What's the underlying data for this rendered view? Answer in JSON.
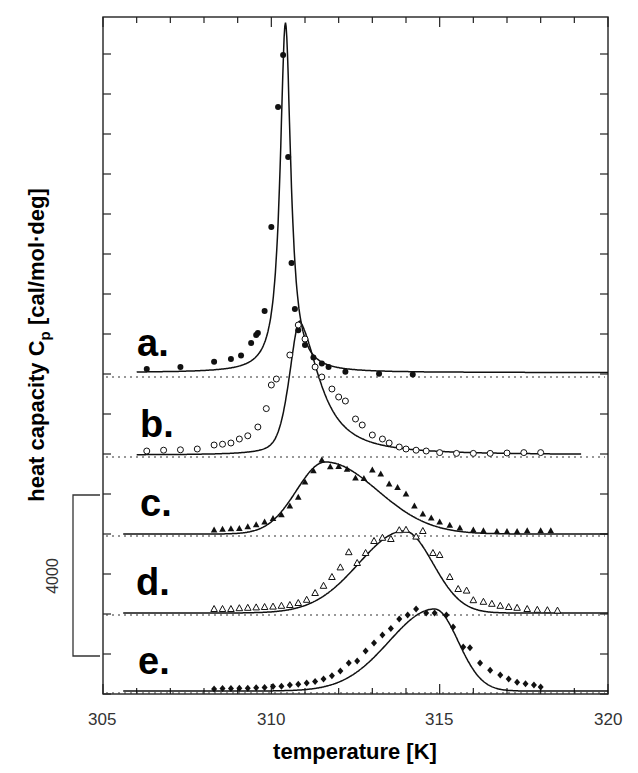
{
  "chart_data": {
    "type": "line",
    "title": "",
    "xlabel": "temperature [K]",
    "ylabel": "heat capacity C_p [cal/mol·deg]",
    "ylabel_main": "heat capacity C",
    "ylabel_sub": "p",
    "ylabel_unit": " [cal/mol·deg]",
    "xlim": [
      305,
      320
    ],
    "xticks": [
      "305",
      "310",
      "315",
      "320"
    ],
    "scale_bar": {
      "label": "4000",
      "value": 4000
    },
    "grid": false,
    "legend": "inline panel labels a.–e.",
    "series": [
      {
        "name": "a.",
        "marker": "filled-circle",
        "peak_T": 310.4,
        "peak_height_rel": 8750,
        "points": [
          [
            306.3,
            150
          ],
          [
            307.3,
            200
          ],
          [
            308.3,
            330
          ],
          [
            308.8,
            400
          ],
          [
            309.1,
            490
          ],
          [
            309.4,
            800
          ],
          [
            309.55,
            1000
          ],
          [
            309.6,
            1050
          ],
          [
            309.8,
            1600
          ],
          [
            310.0,
            3700
          ],
          [
            310.2,
            6700
          ],
          [
            310.35,
            8000
          ],
          [
            310.5,
            5450
          ],
          [
            310.6,
            2800
          ],
          [
            310.7,
            1650
          ],
          [
            310.8,
            1120
          ],
          [
            311.0,
            750
          ],
          [
            311.25,
            440
          ],
          [
            311.5,
            290
          ],
          [
            311.7,
            200
          ],
          [
            312.2,
            80
          ],
          [
            313.2,
            30
          ],
          [
            314.2,
            10
          ]
        ]
      },
      {
        "name": "b.",
        "marker": "open-circle",
        "peak_T": 310.8,
        "peak_height_rel": 3350,
        "points": [
          [
            306.3,
            100
          ],
          [
            306.8,
            120
          ],
          [
            307.3,
            130
          ],
          [
            307.8,
            150
          ],
          [
            308.3,
            250
          ],
          [
            308.55,
            270
          ],
          [
            308.8,
            300
          ],
          [
            309.05,
            400
          ],
          [
            309.3,
            480
          ],
          [
            309.6,
            700
          ],
          [
            309.85,
            1160
          ],
          [
            310.0,
            1750
          ],
          [
            310.15,
            1900
          ],
          [
            310.55,
            2500
          ],
          [
            310.8,
            3250
          ],
          [
            311.0,
            2900
          ],
          [
            311.3,
            2200
          ],
          [
            311.5,
            1950
          ],
          [
            311.8,
            1650
          ],
          [
            312.0,
            1450
          ],
          [
            312.2,
            1350
          ],
          [
            312.5,
            900
          ],
          [
            312.7,
            750
          ],
          [
            313.0,
            500
          ],
          [
            313.3,
            400
          ],
          [
            313.5,
            300
          ],
          [
            313.8,
            200
          ],
          [
            314.0,
            150
          ],
          [
            314.3,
            120
          ],
          [
            314.6,
            100
          ],
          [
            315.0,
            60
          ],
          [
            315.5,
            40
          ],
          [
            316.0,
            40
          ],
          [
            316.5,
            40
          ],
          [
            317.0,
            50
          ],
          [
            317.5,
            60
          ],
          [
            318.0,
            60
          ]
        ]
      },
      {
        "name": "c.",
        "marker": "filled-triangle",
        "peak_T": 311.6,
        "peak_height_rel": 1800,
        "points": [
          [
            308.3,
            100
          ],
          [
            308.55,
            120
          ],
          [
            308.8,
            130
          ],
          [
            309.05,
            140
          ],
          [
            309.3,
            180
          ],
          [
            309.55,
            230
          ],
          [
            309.8,
            300
          ],
          [
            310.05,
            390
          ],
          [
            310.3,
            480
          ],
          [
            310.55,
            700
          ],
          [
            310.8,
            920
          ],
          [
            311.0,
            1300
          ],
          [
            311.25,
            1580
          ],
          [
            311.5,
            1850
          ],
          [
            311.75,
            1680
          ],
          [
            312.0,
            1690
          ],
          [
            312.25,
            1620
          ],
          [
            312.5,
            1400
          ],
          [
            312.75,
            1390
          ],
          [
            313.0,
            1600
          ],
          [
            313.25,
            1500
          ],
          [
            313.5,
            1250
          ],
          [
            313.75,
            1160
          ],
          [
            314.0,
            1000
          ],
          [
            314.25,
            700
          ],
          [
            314.5,
            500
          ],
          [
            314.75,
            400
          ],
          [
            315.0,
            300
          ],
          [
            315.3,
            220
          ],
          [
            315.6,
            150
          ],
          [
            316.0,
            100
          ],
          [
            316.3,
            80
          ],
          [
            316.7,
            60
          ],
          [
            317.0,
            60
          ],
          [
            317.3,
            60
          ],
          [
            317.6,
            80
          ],
          [
            318.0,
            80
          ],
          [
            318.3,
            80
          ]
        ]
      },
      {
        "name": "d.",
        "marker": "open-triangle",
        "peak_T": 313.9,
        "peak_height_rel": 2050,
        "points": [
          [
            308.3,
            100
          ],
          [
            308.55,
            100
          ],
          [
            308.8,
            100
          ],
          [
            309.05,
            120
          ],
          [
            309.3,
            130
          ],
          [
            309.55,
            140
          ],
          [
            309.8,
            150
          ],
          [
            310.05,
            160
          ],
          [
            310.3,
            180
          ],
          [
            310.55,
            200
          ],
          [
            310.8,
            250
          ],
          [
            311.05,
            330
          ],
          [
            311.3,
            500
          ],
          [
            311.55,
            680
          ],
          [
            311.8,
            900
          ],
          [
            312.05,
            1140
          ],
          [
            312.3,
            1520
          ],
          [
            312.55,
            1250
          ],
          [
            312.8,
            1500
          ],
          [
            313.05,
            1800
          ],
          [
            313.3,
            1880
          ],
          [
            313.55,
            1850
          ],
          [
            313.8,
            2070
          ],
          [
            314.0,
            2080
          ],
          [
            314.3,
            1910
          ],
          [
            314.5,
            2050
          ],
          [
            314.8,
            1500
          ],
          [
            315.0,
            1450
          ],
          [
            315.3,
            900
          ],
          [
            315.55,
            600
          ],
          [
            315.8,
            560
          ],
          [
            316.0,
            320
          ],
          [
            316.3,
            280
          ],
          [
            316.55,
            230
          ],
          [
            316.8,
            180
          ],
          [
            317.05,
            150
          ],
          [
            317.3,
            130
          ],
          [
            317.6,
            100
          ],
          [
            317.9,
            80
          ],
          [
            318.2,
            70
          ],
          [
            318.5,
            60
          ]
        ]
      },
      {
        "name": "e.",
        "marker": "filled-diamond",
        "peak_T": 315.0,
        "peak_height_rel": 2050,
        "points": [
          [
            308.3,
            50
          ],
          [
            308.55,
            60
          ],
          [
            308.8,
            60
          ],
          [
            309.05,
            70
          ],
          [
            309.3,
            70
          ],
          [
            309.55,
            80
          ],
          [
            309.8,
            90
          ],
          [
            310.05,
            110
          ],
          [
            310.3,
            120
          ],
          [
            310.55,
            150
          ],
          [
            310.8,
            170
          ],
          [
            311.05,
            200
          ],
          [
            311.3,
            240
          ],
          [
            311.55,
            300
          ],
          [
            311.8,
            380
          ],
          [
            312.05,
            500
          ],
          [
            312.3,
            700
          ],
          [
            312.55,
            750
          ],
          [
            312.8,
            1000
          ],
          [
            313.05,
            1200
          ],
          [
            313.3,
            1400
          ],
          [
            313.55,
            1560
          ],
          [
            313.8,
            1800
          ],
          [
            314.05,
            1900
          ],
          [
            314.3,
            2050
          ],
          [
            314.6,
            1950
          ],
          [
            314.85,
            1950
          ],
          [
            315.2,
            1900
          ],
          [
            315.4,
            1600
          ],
          [
            315.7,
            1100
          ],
          [
            315.9,
            1080
          ],
          [
            316.2,
            700
          ],
          [
            316.5,
            520
          ],
          [
            316.8,
            400
          ],
          [
            317.05,
            300
          ],
          [
            317.3,
            220
          ],
          [
            317.55,
            180
          ],
          [
            317.8,
            150
          ],
          [
            318.0,
            100
          ]
        ]
      }
    ]
  },
  "axis": {
    "x_tick_labels": [
      "305",
      "310",
      "315",
      "320"
    ],
    "xlabel": "temperature [K]",
    "scale_label": "4000"
  },
  "labels": {
    "a": "a.",
    "b": "b.",
    "c": "c.",
    "d": "d.",
    "e": "e."
  }
}
